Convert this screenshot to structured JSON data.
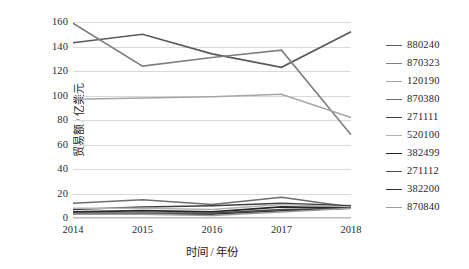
{
  "chart_data": {
    "type": "line",
    "title": "",
    "xlabel": "时间 / 年份",
    "ylabel": "贸易额 / 亿美元",
    "categories": [
      "2014",
      "2015",
      "2016",
      "2017",
      "2018"
    ],
    "x": [
      2014,
      2015,
      2016,
      2017,
      2018
    ],
    "ylim": [
      0,
      160
    ],
    "ytick_labels": [
      "0",
      "20",
      "40",
      "60",
      "80",
      "100",
      "120",
      "140",
      "160"
    ],
    "yticks": [
      0,
      20,
      40,
      60,
      80,
      100,
      120,
      140,
      160
    ],
    "grid": "horizontal",
    "legend_position": "right",
    "series": [
      {
        "name": "880240",
        "color": "#595959",
        "width": 1.6,
        "values": [
          143,
          150,
          134,
          123,
          152
        ]
      },
      {
        "name": "870323",
        "color": "#7f7f7f",
        "width": 1.6,
        "values": [
          159,
          124,
          131,
          137,
          68
        ]
      },
      {
        "name": "120190",
        "color": "#a6a6a6",
        "width": 1.6,
        "values": [
          97,
          98,
          99,
          101,
          82
        ]
      },
      {
        "name": "870380",
        "color": "#6e6e6e",
        "width": 1.5,
        "values": [
          12,
          15,
          11,
          17,
          9
        ]
      },
      {
        "name": "271111",
        "color": "#3f3f3f",
        "width": 1.5,
        "values": [
          7,
          9,
          10,
          12,
          10
        ]
      },
      {
        "name": "520100",
        "color": "#b3b3b3",
        "width": 1.5,
        "values": [
          8,
          8,
          7,
          11,
          9
        ]
      },
      {
        "name": "382499",
        "color": "#262626",
        "width": 1.7,
        "values": [
          5,
          6,
          5,
          9,
          8
        ]
      },
      {
        "name": "271112",
        "color": "#4d4d4d",
        "width": 1.5,
        "values": [
          4,
          4,
          4,
          7,
          8
        ]
      },
      {
        "name": "382200",
        "color": "#333333",
        "width": 1.5,
        "values": [
          3,
          3,
          3,
          6,
          8
        ]
      },
      {
        "name": "870840",
        "color": "#9c9c9c",
        "width": 1.5,
        "values": [
          3,
          3,
          2,
          5,
          8
        ]
      }
    ]
  },
  "style": {
    "grid_color": "#d9d9d9",
    "axis_color": "#bfbfbf",
    "background": "#ffffff",
    "text_color": "#1f1f1f"
  }
}
